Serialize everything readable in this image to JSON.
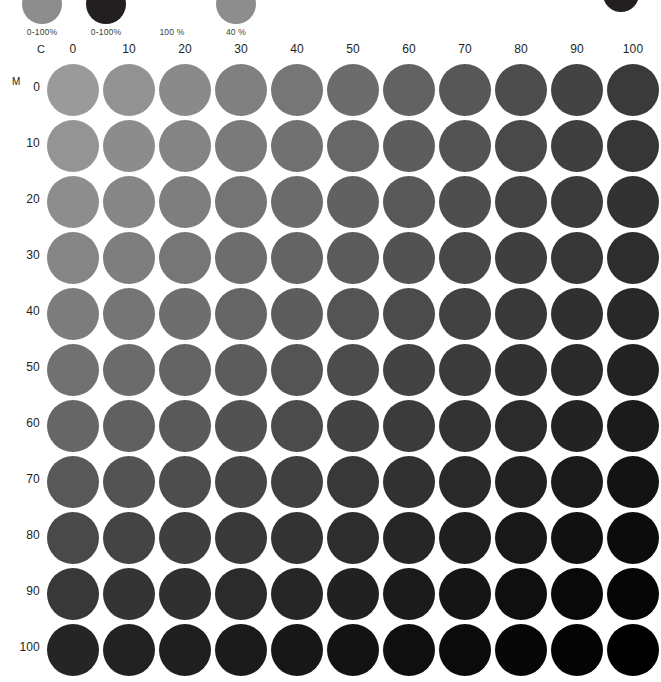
{
  "legend": {
    "items": [
      {
        "caption": "0-100%",
        "swatch": "#8d8d8d",
        "name": "legend-swatch-gray"
      },
      {
        "caption": "0-100%",
        "swatch": "#231f20",
        "name": "legend-swatch-black"
      },
      {
        "caption": "100 %",
        "swatch": "#ffffff",
        "name": "legend-swatch-white"
      },
      {
        "caption": "40 %",
        "swatch": "#8d8d8d",
        "name": "legend-swatch-40"
      }
    ],
    "corner_mark": "#231f20"
  },
  "axes": {
    "c_label": "C",
    "m_label": "M",
    "column_headers": [
      "0",
      "10",
      "20",
      "30",
      "40",
      "50",
      "60",
      "70",
      "80",
      "90",
      "100"
    ],
    "row_headers": [
      "0",
      "10",
      "20",
      "30",
      "40",
      "50",
      "60",
      "70",
      "80",
      "90",
      "100"
    ]
  },
  "chart_data": {
    "type": "heatmap",
    "title": "",
    "xlabel": "C",
    "ylabel": "M",
    "categories": [
      "0",
      "10",
      "20",
      "30",
      "40",
      "50",
      "60",
      "70",
      "80",
      "90",
      "100"
    ],
    "rows": [
      "0",
      "10",
      "20",
      "30",
      "40",
      "50",
      "60",
      "70",
      "80",
      "90",
      "100"
    ],
    "xlim": [
      0,
      100
    ],
    "ylim": [
      0,
      100
    ],
    "grid": false,
    "legend_position": "top",
    "colors": [
      [
        "#9a9a9a",
        "#929292",
        "#8a8a8a",
        "#808080",
        "#767676",
        "#6c6c6c",
        "#626262",
        "#575757",
        "#4d4d4d",
        "#434343",
        "#3a3a3a"
      ],
      [
        "#949494",
        "#8c8c8c",
        "#848484",
        "#7a7a7a",
        "#717171",
        "#676767",
        "#5d5d5d",
        "#535353",
        "#494949",
        "#3f3f3f",
        "#363636"
      ],
      [
        "#8d8d8d",
        "#868686",
        "#7e7e7e",
        "#747474",
        "#6b6b6b",
        "#616161",
        "#585858",
        "#4e4e4e",
        "#444444",
        "#3b3b3b",
        "#323232"
      ],
      [
        "#858585",
        "#7e7e7e",
        "#767676",
        "#6d6d6d",
        "#646464",
        "#5b5b5b",
        "#525252",
        "#484848",
        "#3f3f3f",
        "#363636",
        "#2d2d2d"
      ],
      [
        "#7c7c7c",
        "#757575",
        "#6e6e6e",
        "#656565",
        "#5d5d5d",
        "#545454",
        "#4b4b4b",
        "#424242",
        "#393939",
        "#303030",
        "#282828"
      ],
      [
        "#717171",
        "#6b6b6b",
        "#646464",
        "#5c5c5c",
        "#545454",
        "#4c4c4c",
        "#434343",
        "#3b3b3b",
        "#323232",
        "#2a2a2a",
        "#222222"
      ],
      [
        "#666666",
        "#606060",
        "#595959",
        "#525252",
        "#4b4b4b",
        "#434343",
        "#3b3b3b",
        "#333333",
        "#2b2b2b",
        "#232323",
        "#1b1b1b"
      ],
      [
        "#585858",
        "#535353",
        "#4d4d4d",
        "#464646",
        "#404040",
        "#383838",
        "#313131",
        "#292929",
        "#222222",
        "#1a1a1a",
        "#131313"
      ],
      [
        "#494949",
        "#444444",
        "#3f3f3f",
        "#393939",
        "#333333",
        "#2d2d2d",
        "#262626",
        "#1f1f1f",
        "#181818",
        "#111111",
        "#0c0c0c"
      ],
      [
        "#383838",
        "#343434",
        "#303030",
        "#2b2b2b",
        "#262626",
        "#212121",
        "#1b1b1b",
        "#151515",
        "#0f0f0f",
        "#090909",
        "#060606"
      ],
      [
        "#252525",
        "#222222",
        "#1f1f1f",
        "#1b1b1b",
        "#171717",
        "#131313",
        "#0f0f0f",
        "#0b0b0b",
        "#070707",
        "#040404",
        "#000000"
      ]
    ]
  }
}
